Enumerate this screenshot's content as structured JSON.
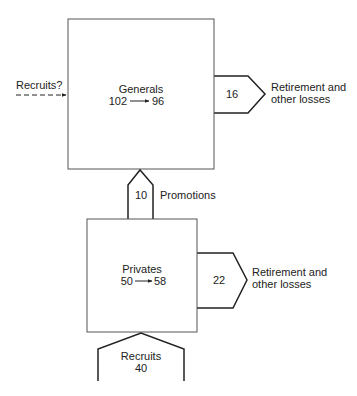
{
  "diagram": {
    "generals": {
      "title": "Generals",
      "start": "102",
      "end": "96"
    },
    "privates": {
      "title": "Privates",
      "start": "50",
      "end": "58"
    },
    "generals_inflow": {
      "label": "Recruits?",
      "style": "dashed"
    },
    "generals_outflow": {
      "value": "16",
      "label_line1": "Retirement and",
      "label_line2": "other losses"
    },
    "promotions": {
      "value": "10",
      "label": "Promotions"
    },
    "privates_outflow": {
      "value": "22",
      "label_line1": "Retirement and",
      "label_line2": "other losses"
    },
    "privates_inflow": {
      "label": "Recruits",
      "value": "40"
    }
  }
}
